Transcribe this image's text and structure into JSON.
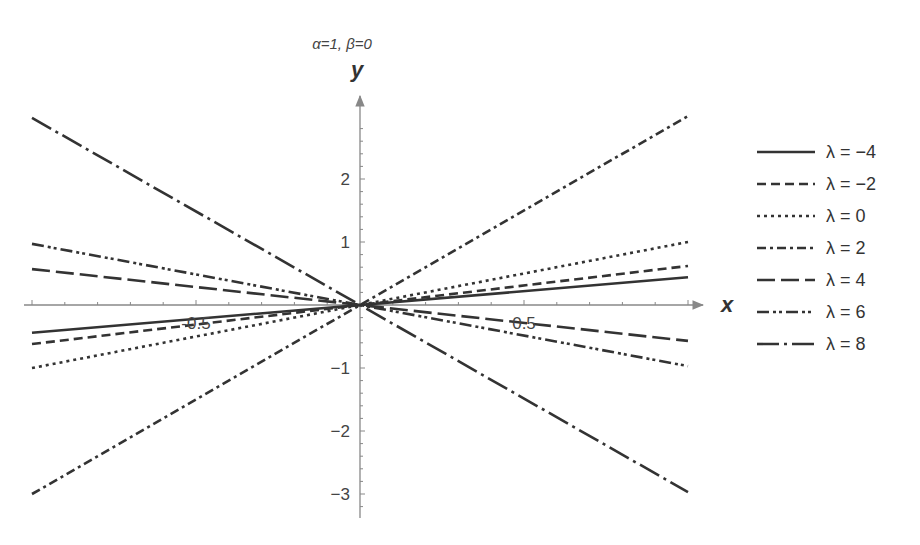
{
  "chart_data": {
    "type": "line",
    "title": "α=1, β=0",
    "xlabel": "x",
    "ylabel": "y",
    "xlim": [
      -1,
      1
    ],
    "ylim": [
      -3.3,
      3.3
    ],
    "x_ticks": [
      -0.5,
      0.5
    ],
    "x_tick_labels": [
      "-0.5",
      "0.5"
    ],
    "y_ticks": [
      -3,
      -2,
      -1,
      1,
      2
    ],
    "y_tick_labels": [
      "−3",
      "−2",
      "−1",
      "1",
      "2"
    ],
    "grid": false,
    "legend_position": "right",
    "x": [
      -1,
      1
    ],
    "series": [
      {
        "name": "λ = −4",
        "style": "solid",
        "values": [
          -0.44,
          0.44
        ]
      },
      {
        "name": "λ = −2",
        "style": "dashed",
        "values": [
          -0.62,
          0.62
        ]
      },
      {
        "name": "λ = 0",
        "style": "dotted",
        "values": [
          -1.0,
          1.0
        ]
      },
      {
        "name": "λ = 2",
        "style": "dash-dot",
        "values": [
          -3.0,
          3.0
        ]
      },
      {
        "name": "λ = 4",
        "style": "long-dash",
        "values": [
          0.57,
          -0.57
        ]
      },
      {
        "name": "λ = 6",
        "style": "dash-dot-dot",
        "values": [
          0.97,
          -0.97
        ]
      },
      {
        "name": "λ = 8",
        "style": "long-dash-dot",
        "values": [
          2.97,
          -2.97
        ]
      }
    ]
  },
  "colors": {
    "line": "#333333",
    "axis": "#888888",
    "text": "#444444"
  }
}
